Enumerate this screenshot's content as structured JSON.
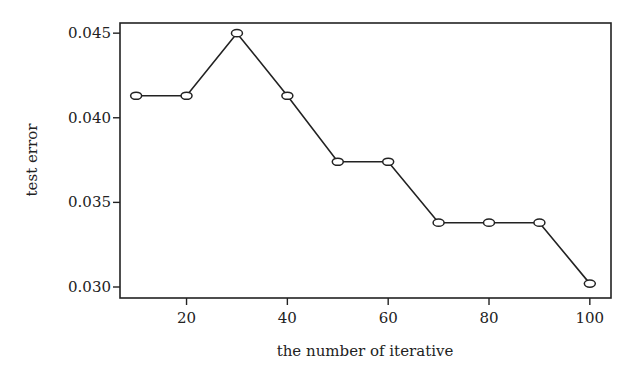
{
  "chart_data": {
    "type": "line",
    "title": "",
    "xlabel": "the number of iterative",
    "ylabel": "test error",
    "x": [
      10,
      20,
      30,
      40,
      50,
      60,
      70,
      80,
      90,
      100
    ],
    "series": [
      {
        "name": "test error",
        "values": [
          0.0413,
          0.0413,
          0.045,
          0.0413,
          0.0374,
          0.0374,
          0.0338,
          0.0338,
          0.0338,
          0.0302
        ],
        "marker": "circle",
        "color": "#222222"
      }
    ],
    "xticks": [
      20,
      40,
      60,
      80,
      100
    ],
    "xtick_labels": [
      "20",
      "40",
      "60",
      "80",
      "100"
    ],
    "yticks": [
      0.03,
      0.035,
      0.04,
      0.045
    ],
    "ytick_labels": [
      "0.030",
      "0.035",
      "0.040",
      "0.045"
    ],
    "xlim": [
      6.8,
      104.2
    ],
    "ylim": [
      0.02935,
      0.0456
    ],
    "grid": false,
    "legend": null
  }
}
